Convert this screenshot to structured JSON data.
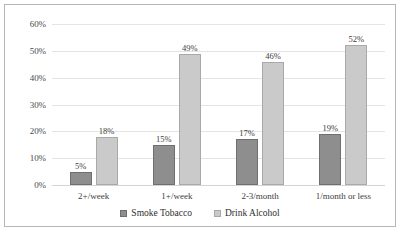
{
  "chart_data": {
    "type": "bar",
    "title": "",
    "subtitle": "",
    "xlabel": "",
    "ylabel": "",
    "categories": [
      "2+/week",
      "1+/week",
      "2-3/month",
      "1/month or less"
    ],
    "series": [
      {
        "name": "Smoke Tobacco",
        "color": "#8e8e8e",
        "values": [
          5,
          15,
          17,
          19
        ],
        "labels": [
          "5%",
          "15%",
          "17%",
          "19%"
        ]
      },
      {
        "name": "Drink Alcohol",
        "color": "#cacaca",
        "values": [
          18,
          49,
          46,
          52
        ],
        "labels": [
          "18%",
          "49%",
          "46%",
          "52%"
        ]
      }
    ],
    "ylim": [
      0,
      60
    ],
    "ytick_values": [
      0,
      10,
      20,
      30,
      40,
      50,
      60
    ],
    "ytick_labels": [
      "0%",
      "10%",
      "20%",
      "30%",
      "40%",
      "50%",
      "60%"
    ],
    "grid": true,
    "grid_axis": "y",
    "legend_position": "bottom",
    "value_labels_shown": true,
    "value_unit": "%",
    "frame_border_color": "#b6b6b6",
    "gridline_color": "#e4e4e4",
    "background_color": "#ffffff"
  }
}
